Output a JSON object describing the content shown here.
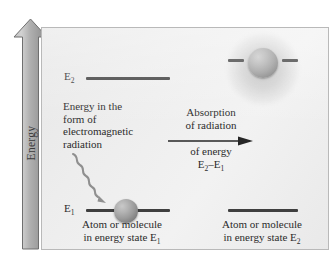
{
  "figure": {
    "title_axis": "Energy",
    "axis_icon": "up-arrow-icon"
  },
  "levels": {
    "upper_left_tag": "E",
    "upper_left_sub": "2",
    "lower_left_tag": "E",
    "lower_left_sub": "1"
  },
  "annotations": {
    "photon_block_line1": "Energy in the",
    "photon_block_line2": "form of",
    "photon_block_line3": "electromagnetic",
    "photon_block_line4": "radiation",
    "process_line1": "Absorption",
    "process_line2": "of radiation",
    "process_line3": "of energy",
    "process_line4_a": "E",
    "process_line4_sub_a": "2",
    "process_line4_dash": "–",
    "process_line4_b": "E",
    "process_line4_sub_b": "1"
  },
  "captions": {
    "left_line1": "Atom or molecule",
    "left_line2_pre": "in energy state E",
    "left_line2_sub": "1",
    "right_line1": "Atom or molecule",
    "right_line2_pre": "in energy state E",
    "right_line2_sub": "2"
  },
  "icons": {
    "photon_wave": "wavy-arrow-icon",
    "process_arrow": "right-arrow-icon",
    "ground_atom": "atom-sphere-icon",
    "excited_atom": "excited-atom-sphere-icon",
    "excited_glow": "glow-halo-icon"
  },
  "colors": {
    "panel_background": "#eeeeee",
    "panel_border": "#b9b9b9",
    "level_line": "#3f3f3f",
    "axis_fill": "#a9a9a9",
    "text": "#2b2b2b",
    "atom_sphere": "#9a9a9a"
  }
}
